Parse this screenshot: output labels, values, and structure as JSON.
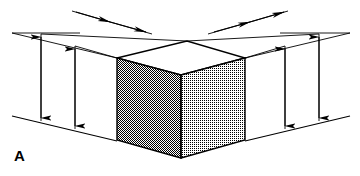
{
  "figure": {
    "panel_label": "A",
    "caption_text": "",
    "background_color": "#ffffff",
    "line_color": "#000000",
    "width": 360,
    "height": 176
  },
  "cube": {
    "name": "isometric-cube",
    "faces": {
      "top": {
        "label": "top-face",
        "fill_color": "#ffffff",
        "shading": "none",
        "points": "117,58 187,41 245,58 181,75"
      },
      "left": {
        "label": "left-face",
        "fill_color": "#595959",
        "shading": "dense-dither-50",
        "points": "117,58 181,75 181,158 117,140"
      },
      "right": {
        "label": "right-face",
        "fill_color": "#b5b5b5",
        "shading": "light-dither-25",
        "points": "181,75 245,58 245,140 181,158"
      }
    },
    "vertices": {
      "top_left": [
        117,
        58
      ],
      "top_back": [
        187,
        41
      ],
      "top_right": [
        245,
        58
      ],
      "top_front": [
        181,
        75
      ],
      "bottom_left": [
        117,
        140
      ],
      "bottom_front": [
        181,
        158
      ],
      "bottom_right": [
        245,
        140
      ]
    }
  },
  "ground_lines": [
    {
      "name": "ground-line-left",
      "x1": 12,
      "y1": 116,
      "x2": 117,
      "y2": 141
    },
    {
      "name": "ground-line-right",
      "x1": 245,
      "y1": 141,
      "x2": 350,
      "y2": 116
    }
  ],
  "extension_lines": [
    {
      "name": "extension-line-upper-left-outer",
      "x1": 30,
      "y1": 29,
      "x2": 108,
      "y2": 8
    },
    {
      "name": "extension-line-upper-right-outer",
      "x1": 252,
      "y1": 8,
      "x2": 330,
      "y2": 29
    },
    {
      "name": "extension-line-left-horizon",
      "x1": 12,
      "y1": 33,
      "x2": 80,
      "y2": 33
    },
    {
      "name": "extension-line-right-horizon",
      "x1": 280,
      "y1": 33,
      "x2": 350,
      "y2": 33
    }
  ],
  "guide_segments": [
    {
      "name": "guide-top-left-upper",
      "x1": 41,
      "y1": 34,
      "x2": 110,
      "y2": 13
    },
    {
      "name": "guide-top-left-inner",
      "x1": 75,
      "y1": 46,
      "x2": 145,
      "y2": 26
    },
    {
      "name": "guide-top-right-upper",
      "x1": 250,
      "y1": 13,
      "x2": 319,
      "y2": 34
    },
    {
      "name": "guide-top-right-inner",
      "x1": 215,
      "y1": 26,
      "x2": 285,
      "y2": 46
    },
    {
      "name": "guide-left-vertical-drop-outer",
      "x1": 41,
      "y1": 34,
      "x2": 41,
      "y2": 121
    },
    {
      "name": "guide-left-vertical-drop-inner",
      "x1": 75,
      "y1": 46,
      "x2": 75,
      "y2": 129
    },
    {
      "name": "guide-right-vertical-drop-inner",
      "x1": 285,
      "y1": 46,
      "x2": 285,
      "y2": 129
    },
    {
      "name": "guide-right-vertical-drop-outer",
      "x1": 319,
      "y1": 34,
      "x2": 319,
      "y2": 121
    },
    {
      "name": "guide-cube-top-left-extend",
      "x1": 117,
      "y1": 58,
      "x2": 41,
      "y2": 34
    },
    {
      "name": "guide-cube-top-back-extend",
      "x1": 187,
      "y1": 41,
      "x2": 110,
      "y2": 13
    },
    {
      "name": "guide-cube-top-right-extend",
      "x1": 245,
      "y1": 58,
      "x2": 319,
      "y2": 34
    },
    {
      "name": "guide-cube-front-extend",
      "x1": 181,
      "y1": 75,
      "x2": 110,
      "y2": 52
    }
  ],
  "dimension_arrows": [
    {
      "name": "dimension-arrow-left-outer",
      "orientation": "vertical",
      "x1": 41,
      "y1": 36,
      "x2": 41,
      "y2": 119,
      "head_start": true,
      "head_end": true
    },
    {
      "name": "dimension-arrow-left-inner",
      "orientation": "vertical",
      "x1": 75,
      "y1": 48,
      "x2": 75,
      "y2": 127,
      "head_start": true,
      "head_end": true
    },
    {
      "name": "dimension-arrow-right-inner",
      "orientation": "vertical",
      "x1": 285,
      "y1": 48,
      "x2": 285,
      "y2": 127,
      "head_start": true,
      "head_end": true
    },
    {
      "name": "dimension-arrow-right-outer",
      "orientation": "vertical",
      "x1": 319,
      "y1": 36,
      "x2": 319,
      "y2": 119,
      "head_start": true,
      "head_end": true
    },
    {
      "name": "dimension-arrow-top-left-upper",
      "orientation": "diagonal",
      "x1": 76,
      "y1": 12,
      "x2": 110,
      "y2": 22,
      "head_start": false,
      "head_end": true
    },
    {
      "name": "dimension-arrow-top-left-inner",
      "orientation": "diagonal",
      "x1": 110,
      "y1": 22,
      "x2": 145,
      "y2": 32,
      "head_start": false,
      "head_end": true
    },
    {
      "name": "dimension-arrow-top-right-inner",
      "orientation": "diagonal",
      "x1": 215,
      "y1": 32,
      "x2": 250,
      "y2": 22,
      "head_start": false,
      "head_end": true
    },
    {
      "name": "dimension-arrow-top-right-upper",
      "orientation": "diagonal",
      "x1": 250,
      "y1": 22,
      "x2": 284,
      "y2": 12,
      "head_start": false,
      "head_end": true
    }
  ]
}
